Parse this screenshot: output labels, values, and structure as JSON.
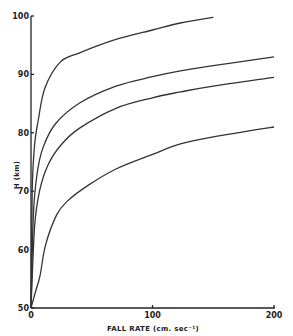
{
  "chart_data": {
    "type": "line",
    "title": "",
    "xlabel": "FALL RATE (cm. sec⁻¹)",
    "ylabel": "H (km)",
    "xlim": [
      0,
      200
    ],
    "ylim": [
      50,
      100
    ],
    "xticks": [
      0,
      100,
      200
    ],
    "yticks": [
      50,
      60,
      70,
      80,
      90,
      100
    ],
    "grid": false,
    "legend": null,
    "series": [
      {
        "name": "curve-1",
        "x": [
          0,
          1,
          3,
          6,
          11.5,
          24,
          40,
          70,
          100,
          123,
          150
        ],
        "y": [
          50,
          70,
          78,
          82.2,
          87.7,
          92.1,
          93.7,
          96,
          97.6,
          98.8,
          99.8
        ]
      },
      {
        "name": "curve-2",
        "x": [
          0,
          2,
          5,
          10,
          20,
          40,
          70,
          100,
          123,
          150,
          200
        ],
        "y": [
          50,
          66,
          73,
          77.5,
          81.5,
          85.1,
          88,
          89.6,
          90.6,
          91.5,
          93
        ]
      },
      {
        "name": "curve-3",
        "x": [
          0,
          3,
          7,
          14,
          25,
          40,
          70,
          100,
          123,
          150,
          200
        ],
        "y": [
          50,
          64,
          70,
          74.5,
          78,
          80.8,
          84.2,
          86,
          87,
          88,
          89.5
        ]
      },
      {
        "name": "curve-4",
        "x": [
          0,
          4,
          7.5,
          12,
          21,
          30,
          47,
          70,
          100,
          123,
          150,
          200
        ],
        "y": [
          50,
          53,
          55.6,
          60.8,
          65.9,
          68.3,
          71,
          73.8,
          76.3,
          78.1,
          79.3,
          81
        ]
      }
    ]
  },
  "axes": {
    "x_tick_labels": [
      "0",
      "100",
      "200"
    ],
    "y_tick_labels": [
      "50",
      "60",
      "70",
      "80",
      "90",
      "100"
    ],
    "x_title": "FALL RATE  (cm. sec⁻¹)",
    "y_title": "H  (km)"
  }
}
